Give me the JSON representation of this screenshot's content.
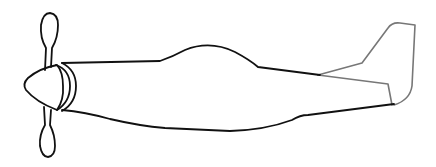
{
  "image": {
    "subject": "airplane line drawing",
    "colors": {
      "background": "#ffffff",
      "body_stroke": "#111111",
      "tail_stroke": "#777777"
    }
  }
}
